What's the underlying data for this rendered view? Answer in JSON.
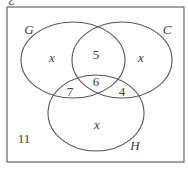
{
  "diagram": {
    "type": "venn",
    "universal_symbol": "ℰ",
    "sets": [
      {
        "name": "G",
        "label": "G"
      },
      {
        "name": "C",
        "label": "C"
      },
      {
        "name": "H",
        "label": "H"
      }
    ],
    "regions": {
      "G_only": "x",
      "C_only": "x",
      "H_only": "x",
      "G_and_C_only": "5",
      "G_and_H_only": "7",
      "C_and_H_only": "4",
      "G_and_C_and_H": "6",
      "outside": "11"
    },
    "colors": {
      "line": "#555555",
      "background": "#ffffff"
    }
  }
}
